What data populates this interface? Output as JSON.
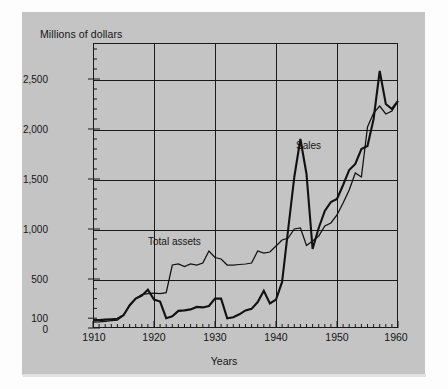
{
  "figure": {
    "background_color": "#c4c4c4",
    "page_color": "#fdfdfd",
    "line_color": "#111111"
  },
  "chart_data": {
    "type": "line",
    "title": "",
    "subtitle": "",
    "ylabel": "Millions of dollars",
    "xlabel": "Years",
    "xlim": [
      1910,
      1960
    ],
    "ylim": [
      0,
      2800
    ],
    "grid": true,
    "legend_position": "inline-annotations",
    "x_ticks": [
      1910,
      1920,
      1930,
      1940,
      1950,
      1960
    ],
    "x_tick_labels": [
      "1910",
      "1920",
      "1930",
      "1940",
      "1950",
      "1960"
    ],
    "x_minor_tick_interval": 1,
    "y_ticks": [
      0,
      100,
      500,
      1000,
      1500,
      2000,
      2500
    ],
    "y_tick_labels": [
      "0",
      "100",
      "500",
      "1,000",
      "1,500",
      "2,000",
      "2,500"
    ],
    "y_axis_note": "Lower segment 0-100 is compressed; 100 sits just above 0 at the baseline, then 500, 1,000, 1,500, 2,000, 2,500 are evenly spaced.",
    "y_gridlines_drawn": [
      500,
      1000,
      1500,
      2000,
      2500
    ],
    "annotations": [
      {
        "text": "Sales",
        "x": 1944.5,
        "y": 1900
      },
      {
        "text": "Total assets",
        "x": 1924.0,
        "y": 820
      }
    ],
    "series": [
      {
        "name": "Sales",
        "line_width": "thick",
        "x": [
          1910,
          1911,
          1912,
          1913,
          1914,
          1915,
          1916,
          1917,
          1918,
          1919,
          1920,
          1921,
          1922,
          1923,
          1924,
          1925,
          1926,
          1927,
          1928,
          1929,
          1930,
          1931,
          1932,
          1933,
          1934,
          1935,
          1936,
          1937,
          1938,
          1939,
          1940,
          1941,
          1942,
          1943,
          1944,
          1945,
          1946,
          1947,
          1948,
          1949,
          1950,
          1951,
          1952,
          1953,
          1954,
          1955,
          1956,
          1957,
          1958,
          1959,
          1960
        ],
        "values": [
          80,
          80,
          85,
          90,
          95,
          130,
          230,
          300,
          330,
          390,
          290,
          270,
          100,
          120,
          175,
          180,
          190,
          215,
          210,
          225,
          300,
          300,
          100,
          110,
          140,
          180,
          195,
          265,
          380,
          250,
          290,
          470,
          1000,
          1520,
          1900,
          1550,
          800,
          1010,
          1180,
          1270,
          1300,
          1440,
          1590,
          1650,
          1800,
          1830,
          2100,
          2580,
          2250,
          2200,
          2280
        ]
      },
      {
        "name": "Total assets",
        "line_width": "thin",
        "x": [
          1910,
          1911,
          1912,
          1913,
          1914,
          1915,
          1916,
          1917,
          1918,
          1919,
          1920,
          1921,
          1922,
          1923,
          1924,
          1925,
          1926,
          1927,
          1928,
          1929,
          1930,
          1931,
          1932,
          1933,
          1934,
          1935,
          1936,
          1937,
          1938,
          1939,
          1940,
          1941,
          1942,
          1943,
          1944,
          1945,
          1946,
          1947,
          1948,
          1949,
          1950,
          1951,
          1952,
          1953,
          1954,
          1955,
          1956,
          1957,
          1958,
          1959,
          1960
        ],
        "values": [
          60,
          62,
          68,
          75,
          80,
          130,
          235,
          300,
          340,
          350,
          355,
          350,
          360,
          640,
          650,
          625,
          650,
          640,
          660,
          780,
          715,
          700,
          640,
          640,
          645,
          650,
          660,
          780,
          760,
          770,
          830,
          890,
          910,
          1000,
          1010,
          835,
          880,
          930,
          1030,
          1060,
          1140,
          1260,
          1390,
          1560,
          1520,
          2020,
          2160,
          2230,
          2150,
          2180,
          2280
        ]
      }
    ]
  }
}
